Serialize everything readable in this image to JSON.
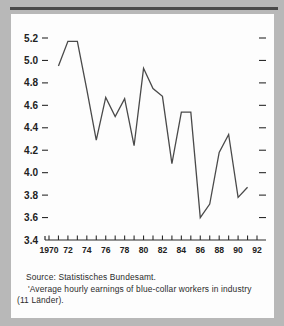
{
  "chart_data": {
    "type": "line",
    "title": "",
    "subtitle": "",
    "xlabel": "",
    "ylabel": "",
    "xlim": [
      1970,
      1992
    ],
    "ylim": [
      3.4,
      5.2
    ],
    "grid": false,
    "legend_position": "none",
    "x": [
      1971,
      1972,
      1973,
      1974,
      1975,
      1976,
      1977,
      1978,
      1979,
      1980,
      1981,
      1982,
      1983,
      1984,
      1985,
      1986,
      1987,
      1988,
      1989,
      1990,
      1991
    ],
    "values": [
      4.95,
      5.17,
      5.17,
      4.74,
      4.29,
      4.67,
      4.5,
      4.66,
      4.24,
      4.93,
      4.75,
      4.68,
      4.08,
      4.54,
      4.54,
      3.6,
      3.72,
      4.18,
      4.34,
      3.78,
      3.87
    ],
    "series": [
      {
        "name": "Average hourly earnings",
        "values": [
          4.95,
          5.17,
          5.17,
          4.74,
          4.29,
          4.67,
          4.5,
          4.66,
          4.24,
          4.93,
          4.75,
          4.68,
          4.08,
          4.54,
          4.54,
          3.6,
          3.72,
          4.18,
          4.34,
          3.78,
          3.87
        ],
        "color": "#4a4a4a"
      }
    ],
    "ytick_labels": [
      "5.2",
      "5.0",
      "4.8",
      "4.6",
      "4.4",
      "4.2",
      "4.0",
      "3.8",
      "3.6",
      "3.4"
    ],
    "ytick_values": [
      5.2,
      5.0,
      4.8,
      4.6,
      4.4,
      4.2,
      4.0,
      3.8,
      3.6,
      3.4
    ],
    "xtick_labels": [
      "1970",
      "72",
      "74",
      "76",
      "78",
      "80",
      "82",
      "84",
      "86",
      "88",
      "90",
      "92"
    ],
    "xtick_values": [
      1970,
      1972,
      1974,
      1976,
      1978,
      1980,
      1982,
      1984,
      1986,
      1988,
      1990,
      1992
    ],
    "xminor_values": [
      1971,
      1973,
      1975,
      1977,
      1979,
      1981,
      1983,
      1985,
      1987,
      1989,
      1991
    ]
  },
  "caption": {
    "source_line": "Source:  Statistisches Bundesamt.",
    "note_line_1": "'Average  hourly  earnings  of  blue-collar  workers  in  industry",
    "note_line_2": "(11 Länder)."
  },
  "colors": {
    "page_background": "#b8b8b8",
    "card_background": "#fdfdfd",
    "rule": "#4a4a4a",
    "axis": "#2b2b2b",
    "series": "#4a4a4a",
    "text": "#222222"
  }
}
